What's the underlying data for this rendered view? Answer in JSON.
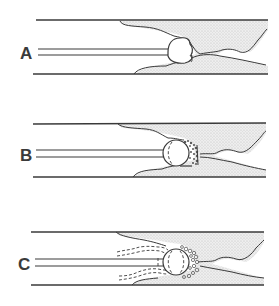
{
  "figure": {
    "type": "three-panel schematic diagram",
    "panels": [
      {
        "label": "A",
        "description": "Wire/catheter with spherical tip advanced up to obstruction in vessel"
      },
      {
        "label": "B",
        "description": "Spherical tip engaging obstruction with fragmented material at leading edge"
      },
      {
        "label": "C",
        "description": "Spherical tip within obstruction, surrounded by fragmented material, with dashed outline of displaced tissue"
      }
    ]
  },
  "colors": {
    "line": "#3a3a3a",
    "shade": "#d9d9d9",
    "background": "#ffffff"
  }
}
